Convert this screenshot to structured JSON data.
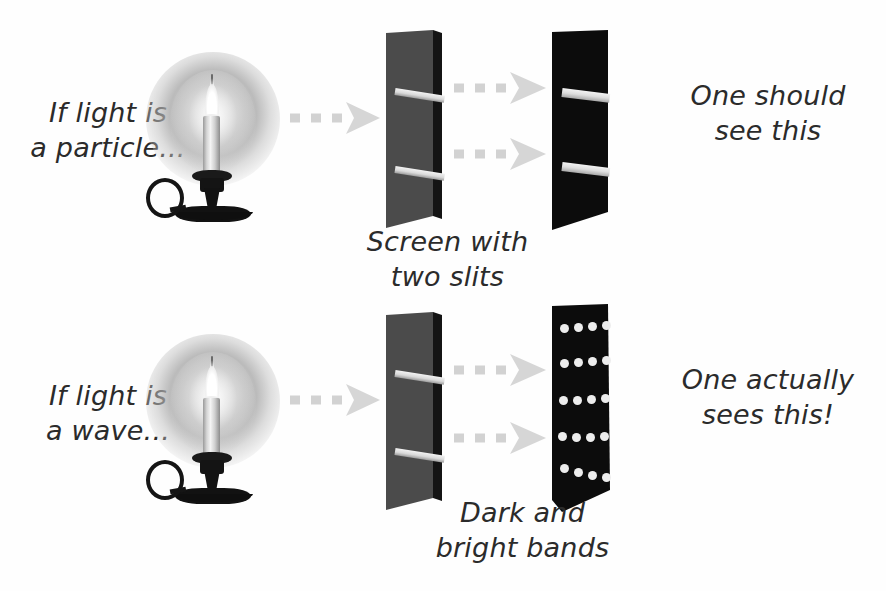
{
  "figure": {
    "background_color": "#ffffff",
    "ink_color": "#2b2b2b"
  },
  "rows": [
    {
      "id": "particle-row",
      "source_label": "If light is\na particle...",
      "slit_screen_caption": "Screen with\ntwo slits",
      "detector_pattern": "two-bright-bands",
      "conclusion_label": "One should\nsee this"
    },
    {
      "id": "wave-row",
      "source_label": "If light is\na wave...",
      "detector_caption": "Dark and\nbright bands",
      "detector_pattern": "interference-fringes",
      "conclusion_label": "One actually\nsees this!"
    }
  ],
  "elements": {
    "candle_icon": "candle-with-holder",
    "arrow_icon": "dashed-right-arrow",
    "slit_screen_icon": "gray-screen-with-two-slits",
    "detector_screen_icon": "black-detector-screen"
  },
  "colors": {
    "slit_screen": "#4a4a4a",
    "slit_screen_edge": "#151515",
    "detector_screen": "#0c0c0c",
    "band_light": "#e8e8e8",
    "arrow_gray": "#d4d4d4",
    "text": "#2b2b2b"
  },
  "patterns": {
    "bright_bands_count": 2,
    "fringe_rows": 5,
    "fringe_dots_per_row": 4
  }
}
